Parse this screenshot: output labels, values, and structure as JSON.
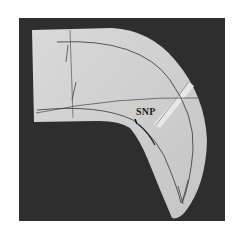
{
  "photo": {
    "description": "Grayscale photograph of a curved fabric pattern piece on a dark background",
    "background_color": "#2e2e2e",
    "fabric_color": "#d6d6d6",
    "line_color": "#333333"
  },
  "annotations": {
    "snp_label": "SNP"
  }
}
